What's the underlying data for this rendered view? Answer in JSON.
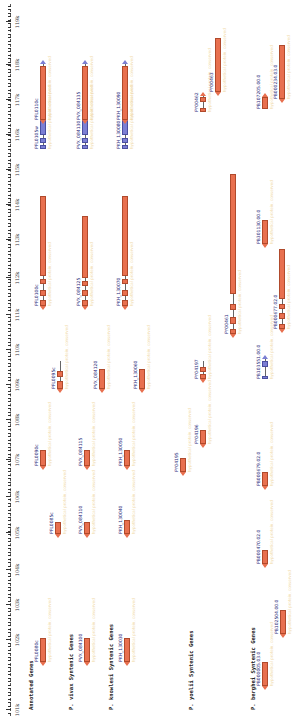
{
  "axis": {
    "ticks": [
      {
        "label": "101k",
        "x": 14
      },
      {
        "label": "102k",
        "x": 84
      },
      {
        "label": "103k",
        "x": 119
      },
      {
        "label": "104k",
        "x": 154
      },
      {
        "label": "105k",
        "x": 191
      },
      {
        "label": "106k",
        "x": 227
      },
      {
        "label": "107k",
        "x": 264
      },
      {
        "label": "108k",
        "x": 304
      },
      {
        "label": "109k",
        "x": 339
      },
      {
        "label": "110k",
        "x": 374
      },
      {
        "label": "111k",
        "x": 409
      },
      {
        "label": "112k",
        "x": 446
      },
      {
        "label": "113k",
        "x": 484
      },
      {
        "label": "114k",
        "x": 519
      },
      {
        "label": "115k",
        "x": 554
      },
      {
        "label": "116k",
        "x": 589
      },
      {
        "label": "117k",
        "x": 624
      },
      {
        "label": "118k",
        "x": 659
      },
      {
        "label": "119k",
        "x": 702
      }
    ]
  },
  "tracks": [
    {
      "label": "Annotated Genes",
      "label_x": 14,
      "label_y": 28,
      "genes": [
        {
          "name": "PFL0080c",
          "x": 62,
          "y": 40,
          "w": 24,
          "strand": "-",
          "color": "orange",
          "exons": []
        },
        {
          "name": "PFL0085c",
          "x": 190,
          "y": 55,
          "w": 12,
          "strand": "-",
          "color": "orange",
          "exons": []
        },
        {
          "name": "PFL0090c",
          "x": 258,
          "y": 40,
          "w": 16,
          "strand": "-",
          "color": "orange",
          "exons": []
        },
        {
          "name": "PFL0095c",
          "x": 335,
          "y": 57,
          "w": 28,
          "strand": "-",
          "color": "orange",
          "exons": [
            {
              "x": 0,
              "w": 8
            },
            {
              "x": 12,
              "w": 6
            }
          ]
        },
        {
          "name": "PFL0100c",
          "x": 418,
          "y": 40,
          "w": 110,
          "strand": "-",
          "color": "orange",
          "exons": [
            {
              "x": 0,
              "w": 6
            },
            {
              "x": 10,
              "w": 6
            },
            {
              "x": 22,
              "w": 5
            },
            {
              "x": 30,
              "w": 80
            }
          ]
        },
        {
          "name": "PFL0105w",
          "x": 575,
          "y": 40,
          "w": 85,
          "strand": "+",
          "color": "blue",
          "exons": [
            {
              "x": 0,
              "w": 4
            },
            {
              "x": 6,
              "w": 5
            },
            {
              "x": 14,
              "w": 28
            },
            {
              "x": 48,
              "w": 5
            },
            {
              "x": 58,
              "w": 4
            },
            {
              "x": 66,
              "w": 5
            },
            {
              "x": 76,
              "w": 4
            }
          ]
        },
        {
          "name": "PFL0110c",
          "x": 604,
          "y": 40,
          "w": 54,
          "strand": "-",
          "color": "orange",
          "exons": []
        }
      ],
      "descriptions": [
        "conserved Plasmodium protein, unknown function",
        "hypothetical protein",
        "conserved protein, unknown function"
      ]
    },
    {
      "label": "P. vivax Syntenic Genes",
      "label_x": 14,
      "label_y": 68,
      "genes": [
        {
          "name": "PVX_084100",
          "x": 62,
          "y": 84,
          "w": 24,
          "strand": "-",
          "color": "orange",
          "exons": []
        },
        {
          "name": "PVX_084110",
          "x": 190,
          "y": 84,
          "w": 12,
          "strand": "-",
          "color": "orange",
          "exons": []
        },
        {
          "name": "PVX_084115",
          "x": 258,
          "y": 84,
          "w": 16,
          "strand": "-",
          "color": "orange",
          "exons": []
        },
        {
          "name": "PVX_084120",
          "x": 335,
          "y": 99,
          "w": 20,
          "strand": "-",
          "color": "orange",
          "exons": []
        },
        {
          "name": "PVX_084125",
          "x": 418,
          "y": 82,
          "w": 90,
          "strand": "-",
          "color": "orange",
          "exons": [
            {
              "x": 0,
              "w": 6
            },
            {
              "x": 10,
              "w": 6
            },
            {
              "x": 20,
              "w": 5
            },
            {
              "x": 28,
              "w": 62
            }
          ]
        },
        {
          "name": "PVX_084130",
          "x": 575,
          "y": 82,
          "w": 85,
          "strand": "+",
          "color": "blue",
          "exons": [
            {
              "x": 0,
              "w": 4
            },
            {
              "x": 6,
              "w": 5
            },
            {
              "x": 14,
              "w": 28
            },
            {
              "x": 48,
              "w": 5
            },
            {
              "x": 58,
              "w": 4
            },
            {
              "x": 66,
              "w": 5
            },
            {
              "x": 76,
              "w": 4
            }
          ]
        },
        {
          "name": "PVX_084135",
          "x": 604,
          "y": 82,
          "w": 54,
          "strand": "-",
          "color": "orange",
          "exons": []
        }
      ]
    },
    {
      "label": "P. knowlesi Syntenic Genes",
      "label_x": 14,
      "label_y": 108,
      "genes": [
        {
          "name": "PKH_130030",
          "x": 62,
          "y": 124,
          "w": 24,
          "strand": "-",
          "color": "orange",
          "exons": []
        },
        {
          "name": "PKH_130040",
          "x": 190,
          "y": 124,
          "w": 14,
          "strand": "-",
          "color": "orange",
          "exons": []
        },
        {
          "name": "PKH_130050",
          "x": 258,
          "y": 124,
          "w": 16,
          "strand": "-",
          "color": "orange",
          "exons": []
        },
        {
          "name": "PKH_130060",
          "x": 335,
          "y": 139,
          "w": 20,
          "strand": "-",
          "color": "orange",
          "exons": []
        },
        {
          "name": "PKH_130070",
          "x": 418,
          "y": 122,
          "w": 110,
          "strand": "-",
          "color": "orange",
          "exons": [
            {
              "x": 0,
              "w": 6
            },
            {
              "x": 10,
              "w": 6
            },
            {
              "x": 22,
              "w": 5
            },
            {
              "x": 30,
              "w": 80
            }
          ]
        },
        {
          "name": "PKH_130080",
          "x": 575,
          "y": 122,
          "w": 85,
          "strand": "+",
          "color": "blue",
          "exons": [
            {
              "x": 0,
              "w": 4
            },
            {
              "x": 6,
              "w": 5
            },
            {
              "x": 14,
              "w": 28
            },
            {
              "x": 48,
              "w": 5
            },
            {
              "x": 58,
              "w": 4
            },
            {
              "x": 66,
              "w": 5
            },
            {
              "x": 76,
              "w": 4
            }
          ]
        },
        {
          "name": "PKH_130090",
          "x": 604,
          "y": 122,
          "w": 54,
          "strand": "-",
          "color": "orange",
          "exons": []
        }
      ]
    },
    {
      "label": "P. yoelii Syntenic Genes",
      "label_x": 14,
      "label_y": 188,
      "genes": [
        {
          "name": "PY04195",
          "x": 252,
          "y": 180,
          "w": 14,
          "strand": "-",
          "color": "orange",
          "exons": []
        },
        {
          "name": "PY04196",
          "x": 280,
          "y": 200,
          "w": 14,
          "strand": "-",
          "color": "orange",
          "exons": []
        },
        {
          "name": "PY04197",
          "x": 345,
          "y": 200,
          "w": 18,
          "strand": "-",
          "color": "orange",
          "exons": [
            {
              "x": 0,
              "w": 5
            },
            {
              "x": 7,
              "w": 5
            }
          ]
        },
        {
          "name": "PY00461",
          "x": 390,
          "y": 230,
          "w": 160,
          "strand": "-",
          "color": "orange",
          "exons": [
            {
              "x": 0,
              "w": 5
            },
            {
              "x": 10,
              "w": 7
            },
            {
              "x": 24,
              "w": 6
            },
            {
              "x": 40,
              "w": 120
            }
          ]
        },
        {
          "name": "PY00462",
          "x": 612,
          "y": 200,
          "w": 16,
          "strand": "+",
          "color": "orange",
          "exons": [
            {
              "x": 0,
              "w": 4
            },
            {
              "x": 10,
              "w": 5
            }
          ]
        },
        {
          "name": "PY00463",
          "x": 632,
          "y": 215,
          "w": 54,
          "strand": "-",
          "color": "orange",
          "exons": []
        }
      ]
    },
    {
      "label": "P. berghei Syntenic Genes",
      "label_x": 14,
      "label_y": 250,
      "genes": [
        {
          "name": "PB000005.03.0",
          "x": 38,
          "y": 262,
          "w": 24,
          "strand": "-",
          "color": "orange",
          "exons": []
        },
        {
          "name": "PB102504.00.0",
          "x": 90,
          "y": 280,
          "w": 24,
          "strand": "-",
          "color": "orange",
          "exons": []
        },
        {
          "name": "PB000470.02.0",
          "x": 160,
          "y": 262,
          "w": 14,
          "strand": "-",
          "color": "orange",
          "exons": []
        },
        {
          "name": "PB000679.02.0",
          "x": 238,
          "y": 262,
          "w": 14,
          "strand": "-",
          "color": "orange",
          "exons": []
        },
        {
          "name": "PB103551.00.0",
          "x": 345,
          "y": 262,
          "w": 20,
          "strand": "+",
          "color": "blue",
          "exons": [
            {
              "x": 0,
              "w": 3
            },
            {
              "x": 12,
              "w": 6
            }
          ]
        },
        {
          "name": "PB000677.02.0",
          "x": 395,
          "y": 279,
          "w": 80,
          "strand": "-",
          "color": "orange",
          "exons": [
            {
              "x": 0,
              "w": 5
            },
            {
              "x": 10,
              "w": 6
            },
            {
              "x": 20,
              "w": 5
            },
            {
              "x": 30,
              "w": 50
            }
          ]
        },
        {
          "name": "PB301130.00.0",
          "x": 480,
          "y": 262,
          "w": 24,
          "strand": "-",
          "color": "orange",
          "exons": []
        },
        {
          "name": "PB107205.00.0",
          "x": 615,
          "y": 262,
          "w": 12,
          "strand": "+",
          "color": "orange",
          "exons": []
        },
        {
          "name": "PB000234.03.0",
          "x": 625,
          "y": 279,
          "w": 54,
          "strand": "-",
          "color": "orange",
          "exons": []
        }
      ]
    }
  ],
  "colors": {
    "gene_orange": "#e8704f",
    "gene_blue": "#7b7fd4",
    "description_text": "#f0d9a8",
    "label_text": "#2a2a7a"
  }
}
